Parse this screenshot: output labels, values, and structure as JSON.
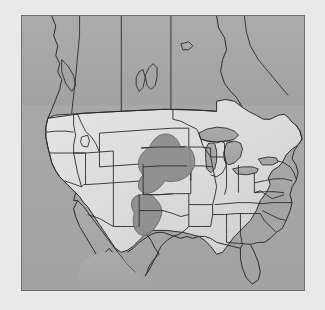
{
  "figure": {
    "kind": "map",
    "region_title": "United States",
    "projection_note": "conic",
    "frame": {
      "x": 21,
      "y": 15,
      "width": 284,
      "height": 276
    }
  },
  "colors": {
    "page_background": "#ffffff",
    "ocean_background": "#a8a8a8",
    "land_fill": "#d8d8d8",
    "land_fill_light": "#e2e2e2",
    "highlight_fill": "#8a8a8a",
    "border_line": "#333333",
    "frame_line": "#6f6f6f",
    "coast_line": "#2b2b2b"
  },
  "highlight": {
    "label": "highlighted-region",
    "description": "north-south band across the central Great Plains",
    "states_covered": [
      "Nebraska",
      "Kansas",
      "Oklahoma",
      "Texas Panhandle"
    ],
    "fill": "#8a8a8a"
  },
  "features": {
    "great_lakes": [
      "Lake Superior",
      "Lake Michigan",
      "Lake Huron",
      "Lake Erie",
      "Lake Ontario"
    ],
    "inland_lakes": [
      "Lake Winnipeg",
      "Great Salt Lake"
    ],
    "peninsulas": [
      "Florida",
      "Baja California",
      "Michigan Upper Peninsula"
    ],
    "countries": [
      "United States",
      "Canada",
      "Mexico"
    ]
  },
  "legend": {
    "visible": false,
    "items": []
  },
  "annotations": {
    "title_text": "",
    "caption_text": "",
    "scale_bar": "",
    "north_arrow": ""
  }
}
